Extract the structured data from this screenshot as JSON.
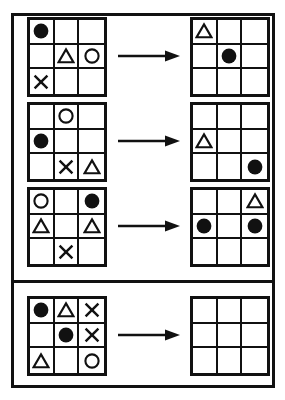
{
  "puzzle": {
    "type": "visual-analogy-matrix",
    "title": "Shape grid transformation puzzle",
    "colors": {
      "ink": "#111111",
      "background": "#ffffff",
      "fill": "#111111"
    },
    "grid_size": {
      "rows": 3,
      "cols": 3
    },
    "shape_glyphs": {
      "filled-circle": "●",
      "circle": "○",
      "triangle": "△",
      "cross": "✕",
      "empty": ""
    },
    "arrow": {
      "name": "right-arrow-icon",
      "direction": "right"
    },
    "examples_panel": {
      "label": "Examples",
      "rows": [
        {
          "id": "example-1",
          "arrow_label": "transforms to",
          "input": {
            "label": "Example 1 input grid",
            "cells": [
              "filled-circle",
              "empty",
              "empty",
              "empty",
              "triangle",
              "circle",
              "cross",
              "empty",
              "empty"
            ]
          },
          "output": {
            "label": "Example 1 output grid",
            "cells": [
              "triangle",
              "empty",
              "empty",
              "empty",
              "filled-circle",
              "empty",
              "empty",
              "empty",
              "empty"
            ]
          }
        },
        {
          "id": "example-2",
          "arrow_label": "transforms to",
          "input": {
            "label": "Example 2 input grid",
            "cells": [
              "empty",
              "circle",
              "empty",
              "filled-circle",
              "empty",
              "empty",
              "empty",
              "cross",
              "triangle"
            ]
          },
          "output": {
            "label": "Example 2 output grid",
            "cells": [
              "empty",
              "empty",
              "empty",
              "triangle",
              "empty",
              "empty",
              "empty",
              "empty",
              "filled-circle"
            ]
          }
        },
        {
          "id": "example-3",
          "arrow_label": "transforms to",
          "input": {
            "label": "Example 3 input grid",
            "cells": [
              "circle",
              "empty",
              "filled-circle",
              "triangle",
              "empty",
              "triangle",
              "empty",
              "cross",
              "empty"
            ]
          },
          "output": {
            "label": "Example 3 output grid",
            "cells": [
              "empty",
              "empty",
              "triangle",
              "filled-circle",
              "empty",
              "filled-circle",
              "empty",
              "empty",
              "empty"
            ]
          }
        }
      ]
    },
    "question_panel": {
      "label": "Question",
      "rows": [
        {
          "id": "question-1",
          "arrow_label": "transforms to",
          "input": {
            "label": "Question input grid",
            "cells": [
              "filled-circle",
              "triangle",
              "cross",
              "empty",
              "filled-circle",
              "cross",
              "triangle",
              "empty",
              "circle"
            ]
          },
          "output": {
            "label": "Answer grid (blank)",
            "cells": [
              "empty",
              "empty",
              "empty",
              "empty",
              "empty",
              "empty",
              "empty",
              "empty",
              "empty"
            ]
          }
        }
      ]
    }
  }
}
